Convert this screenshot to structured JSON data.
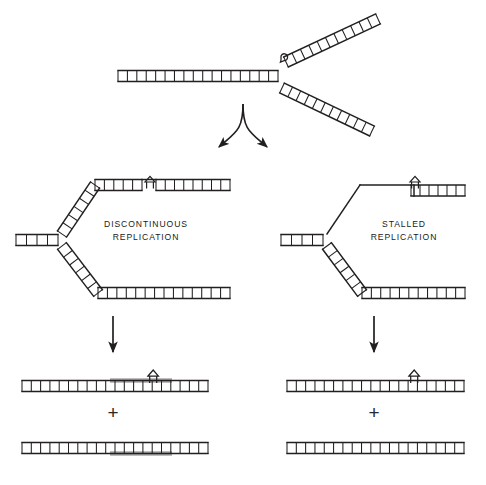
{
  "figure": {
    "background_color": "#ffffff",
    "stroke_color": "#231f20",
    "highlight_color": "#a8a8a8",
    "labels": {
      "left_pathway_line1": "DISCONTINUOUS",
      "left_pathway_line2": "REPLICATION",
      "right_pathway_line1": "STALLED",
      "right_pathway_line2": "REPLICATION",
      "plus_symbol": "+"
    },
    "icons": {
      "lesion": "lesion-marker-icon",
      "fork_knob": "fork-knob-icon",
      "branch_arrow": "branching-arrow-icon",
      "down_arrow": "down-arrow-icon"
    },
    "panels": [
      {
        "id": "top",
        "name": "replication-fork-with-lesion",
        "description": "Parental duplex DNA splitting into two daughter arms at a replication fork; a lesion sits on the upper nascent arm"
      },
      {
        "id": "middle-left",
        "name": "discontinuous-replication-intermediate",
        "description": "Fork where synthesis continues past the lesion leaving a gap opposite the lesion on the leading arm"
      },
      {
        "id": "middle-right",
        "name": "stalled-replication-intermediate",
        "description": "Fork where the upper nascent strand is absent (single-stranded) up to the lesion, indicating stalled synthesis"
      },
      {
        "id": "bottom-left",
        "name": "discontinuous-replication-products",
        "description": "Two daughter duplexes; grey segments mark newly synthesised DNA, one duplex retains the lesion"
      },
      {
        "id": "bottom-right",
        "name": "stalled-replication-products",
        "description": "Two daughter duplexes with no newly synthesised grey tracts; one duplex retains the lesion"
      }
    ]
  }
}
